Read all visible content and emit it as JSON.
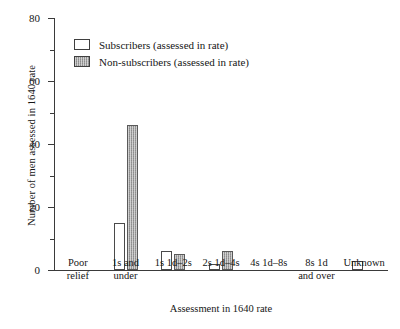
{
  "chart_data": {
    "type": "bar",
    "title": "",
    "xlabel": "Assessment in 1640 rate",
    "ylabel": "Number of men assessed in 1640 rate",
    "categories": [
      "Poor\nrelief",
      "1s and\nunder",
      "1s 1d–2s",
      "2s 1d–4s",
      "4s 1d–8s",
      "8s 1d\nand over",
      "Unknown"
    ],
    "series": [
      {
        "name": "Subscribers (assessed in rate)",
        "values": [
          0,
          15,
          6,
          2,
          0,
          0,
          3
        ],
        "color": "#ffffff"
      },
      {
        "name": "Non-subscribers (assessed in rate)",
        "values": [
          0,
          46,
          5,
          6,
          0,
          0,
          0
        ],
        "color": "#9c9c9c"
      }
    ],
    "ylim": [
      0,
      80
    ],
    "yticks": [
      0,
      20,
      40,
      60,
      80
    ],
    "yticklabels": [
      "0",
      "20",
      "40",
      "60",
      "80"
    ],
    "yminorticks": [
      10,
      30,
      50,
      70
    ],
    "grid": false,
    "legend_position": "upper-left-inside"
  },
  "legend": {
    "entries": [
      {
        "label": "Subscribers (assessed in rate)",
        "swatch": "white-open-square"
      },
      {
        "label": "Non-subscribers (assessed in rate)",
        "swatch": "grey-hatched-square"
      }
    ]
  }
}
